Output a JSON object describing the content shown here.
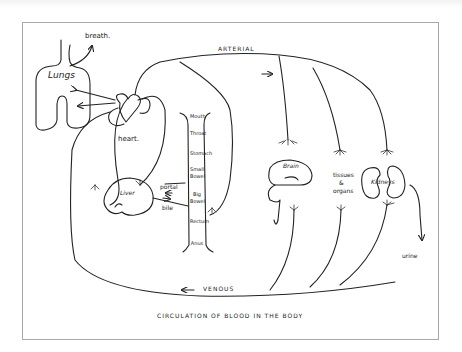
{
  "diagram": {
    "title": "CIRCULATION OF BLOOD IN THE BODY",
    "flow_labels": {
      "arterial": "ARTERIAL",
      "venous": "VENOUS"
    },
    "organs": {
      "lungs": "Lungs",
      "heart": "heart.",
      "liver": "Liver",
      "brain": "Brain",
      "tissues": [
        "tissues",
        "&",
        "organs"
      ],
      "kidneys": "Kidneys"
    },
    "annotations": {
      "breath": "breath.",
      "portal": "portal",
      "bile": "bile",
      "urine": "urine"
    },
    "digestive_tract": [
      "Mouth",
      "Throat",
      "Stomach",
      "Small",
      "Bowel",
      "Big",
      "Bowel",
      "Rectum",
      "Anus"
    ],
    "colors": {
      "ink": "#222222",
      "frame": "#a8a8a8",
      "paper": "#ffffff"
    }
  }
}
